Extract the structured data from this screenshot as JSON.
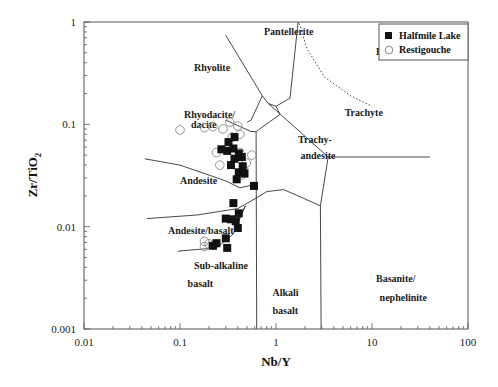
{
  "chart_data": {
    "type": "scatter",
    "title": "",
    "xlabel": "Nb/Y",
    "ylabel": "Zr/TiO2",
    "xscale": "log",
    "yscale": "log",
    "xlim": [
      0.01,
      100
    ],
    "ylim": [
      0.001,
      1
    ],
    "x_ticks": [
      "0.01",
      "0.1",
      "1",
      "10",
      "100"
    ],
    "y_ticks": [
      "0.001",
      "0.01",
      "0.1",
      "1"
    ],
    "grid": false,
    "legend_position": "upper right",
    "legend": [
      {
        "name": "Halfmile Lake",
        "marker": "filled-square"
      },
      {
        "name": "Restigouche",
        "marker": "open-circle"
      }
    ],
    "series": [
      {
        "name": "Halfmile Lake",
        "marker": "filled-square",
        "points": [
          [
            0.37,
            0.075
          ],
          [
            0.32,
            0.067
          ],
          [
            0.27,
            0.057
          ],
          [
            0.31,
            0.055
          ],
          [
            0.36,
            0.058
          ],
          [
            0.41,
            0.052
          ],
          [
            0.44,
            0.048
          ],
          [
            0.37,
            0.046
          ],
          [
            0.45,
            0.039
          ],
          [
            0.34,
            0.04
          ],
          [
            0.41,
            0.034
          ],
          [
            0.47,
            0.033
          ],
          [
            0.39,
            0.029
          ],
          [
            0.59,
            0.025
          ],
          [
            0.36,
            0.017
          ],
          [
            0.3,
            0.012
          ],
          [
            0.34,
            0.0118
          ],
          [
            0.38,
            0.0113
          ],
          [
            0.41,
            0.0135
          ],
          [
            0.4,
            0.0097
          ],
          [
            0.24,
            0.0069
          ],
          [
            0.3,
            0.0077
          ],
          [
            0.31,
            0.0062
          ],
          [
            0.22,
            0.0065
          ]
        ]
      },
      {
        "name": "Restigouche",
        "marker": "open-circle",
        "points": [
          [
            0.1,
            0.088
          ],
          [
            0.18,
            0.093
          ],
          [
            0.22,
            0.095
          ],
          [
            0.28,
            0.09
          ],
          [
            0.33,
            0.105
          ],
          [
            0.4,
            0.096
          ],
          [
            0.35,
            0.075
          ],
          [
            0.42,
            0.08
          ],
          [
            0.24,
            0.053
          ],
          [
            0.42,
            0.053
          ],
          [
            0.56,
            0.05
          ],
          [
            0.26,
            0.04
          ],
          [
            0.49,
            0.042
          ],
          [
            0.44,
            0.032
          ],
          [
            0.46,
            0.036
          ],
          [
            0.18,
            0.0072
          ],
          [
            0.2,
            0.0068
          ],
          [
            0.18,
            0.0064
          ]
        ]
      }
    ],
    "field_labels": [
      {
        "text": "Rhyolite",
        "x": 0.14,
        "y": 0.33
      },
      {
        "text": "Pantellerite",
        "x": 0.75,
        "y": 0.75
      },
      {
        "text": "Phonolite",
        "x": 11,
        "y": 0.48
      },
      {
        "text": "Rhyodacite/",
        "x": 0.11,
        "y": 0.115
      },
      {
        "text": "dacite",
        "x": 0.13,
        "y": 0.092
      },
      {
        "text": "Trachyte",
        "x": 5.2,
        "y": 0.12
      },
      {
        "text": "Trachy-",
        "x": 1.7,
        "y": 0.066
      },
      {
        "text": "andesite",
        "x": 1.8,
        "y": 0.046
      },
      {
        "text": "Andesite",
        "x": 0.1,
        "y": 0.026
      },
      {
        "text": "Andesite/basalt",
        "x": 0.075,
        "y": 0.0085
      },
      {
        "text": "Sub-alkaline",
        "x": 0.14,
        "y": 0.0039
      },
      {
        "text": "basalt",
        "x": 0.12,
        "y": 0.0026
      },
      {
        "text": "Alkali",
        "x": 0.92,
        "y": 0.0021
      },
      {
        "text": "basalt",
        "x": 0.92,
        "y": 0.0014
      },
      {
        "text": "Basanite/",
        "x": 11,
        "y": 0.0029
      },
      {
        "text": "nephelinite",
        "x": 12,
        "y": 0.0019
      }
    ],
    "boundaries": [
      {
        "style": "solid",
        "points": [
          [
            0.3,
            0.74
          ],
          [
            0.72,
            0.19
          ],
          [
            0.83,
            0.16
          ],
          [
            3.5,
            0.048
          ],
          [
            7.5,
            0.048
          ],
          [
            40,
            0.048
          ]
        ]
      },
      {
        "style": "solid",
        "points": [
          [
            0.72,
            0.19
          ],
          [
            0.55,
            0.11
          ],
          [
            0.5,
            0.105
          ]
        ]
      },
      {
        "style": "solid",
        "points": [
          [
            0.3,
            0.11
          ],
          [
            0.55,
            0.085
          ]
        ]
      },
      {
        "style": "solid",
        "points": [
          [
            0.83,
            0.16
          ],
          [
            1.0,
            0.15
          ],
          [
            1.4,
            0.18
          ],
          [
            1.7,
            1.0
          ]
        ]
      },
      {
        "style": "solid",
        "points": [
          [
            0.62,
            0.085
          ],
          [
            0.63,
            0.001
          ]
        ]
      },
      {
        "style": "solid",
        "points": [
          [
            0.55,
            0.085
          ],
          [
            0.62,
            0.085
          ],
          [
            1.1,
            0.125
          ],
          [
            1.0,
            0.15
          ]
        ]
      },
      {
        "style": "solid",
        "points": [
          [
            0.043,
            0.046
          ],
          [
            0.1,
            0.04
          ],
          [
            0.3,
            0.028
          ],
          [
            0.42,
            0.024
          ],
          [
            0.62,
            0.026
          ]
        ]
      },
      {
        "style": "solid",
        "points": [
          [
            0.045,
            0.012
          ],
          [
            0.15,
            0.013
          ],
          [
            0.4,
            0.015
          ],
          [
            0.62,
            0.019
          ],
          [
            0.8,
            0.022
          ],
          [
            1.2,
            0.023
          ],
          [
            1.7,
            0.02
          ],
          [
            2.9,
            0.016
          ],
          [
            3.5,
            0.048
          ]
        ]
      },
      {
        "style": "solid",
        "points": [
          [
            2.9,
            0.016
          ],
          [
            2.95,
            0.001
          ]
        ]
      },
      {
        "style": "solid",
        "points": [
          [
            0.4,
            0.0115
          ],
          [
            0.48,
            0.016
          ]
        ]
      },
      {
        "style": "solid",
        "points": [
          [
            0.48,
            0.016
          ],
          [
            0.36,
            0.0085
          ],
          [
            0.24,
            0.0062
          ],
          [
            0.1,
            0.0058
          ],
          [
            0.095,
            0.0057
          ]
        ]
      },
      {
        "style": "dotted",
        "points": [
          [
            1.75,
            0.97
          ],
          [
            2.1,
            0.55
          ],
          [
            3.2,
            0.29
          ],
          [
            6,
            0.19
          ],
          [
            10,
            0.15
          ]
        ]
      }
    ]
  },
  "legend": {
    "items": [
      {
        "label": "Halfmile Lake"
      },
      {
        "label": "Restigouche"
      }
    ]
  },
  "axes": {
    "xlabel": "Nb/Y",
    "ylabel_main": "Zr/TiO",
    "ylabel_sub": "2"
  }
}
